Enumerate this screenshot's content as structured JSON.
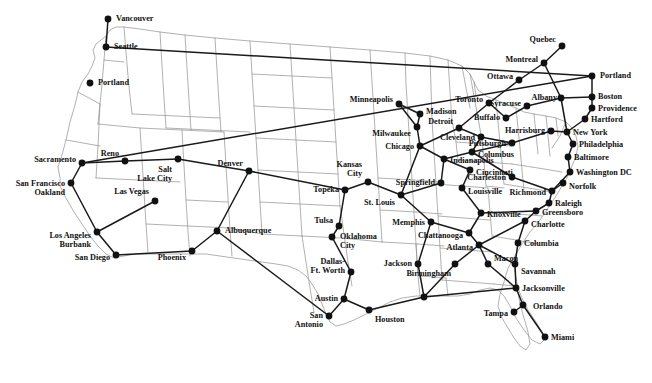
{
  "map": {
    "title": "United States Airline Route Network Map",
    "width": 652,
    "height": 383,
    "background_color": "#ffffff",
    "state_outline_color": "#8a8a8a",
    "route_color": "#1a1a1a",
    "node_color": "#111111",
    "label_color": "#111111"
  },
  "cities": [
    {
      "name": "Vancouver",
      "x": 108,
      "y": 19,
      "lx": 116,
      "ly": 15,
      "align": "l"
    },
    {
      "name": "Seattle",
      "x": 106,
      "y": 47,
      "lx": 114,
      "ly": 43,
      "align": "l"
    },
    {
      "name": "Portland",
      "x": 90,
      "y": 83,
      "lx": 98,
      "ly": 79,
      "align": "l"
    },
    {
      "name": "Sacramento",
      "x": 82,
      "y": 163,
      "lx": 76,
      "ly": 156,
      "align": "r"
    },
    {
      "name": "San Francisco\nOakland",
      "x": 71,
      "y": 183,
      "lx": 65,
      "ly": 180,
      "align": "r"
    },
    {
      "name": "Los Angeles\nBurbank",
      "x": 97,
      "y": 232,
      "lx": 91,
      "ly": 232,
      "align": "r"
    },
    {
      "name": "San Diego",
      "x": 116,
      "y": 255,
      "lx": 110,
      "ly": 254,
      "align": "r"
    },
    {
      "name": "Reno",
      "x": 125,
      "y": 161,
      "lx": 119,
      "ly": 150,
      "align": "r"
    },
    {
      "name": "Las Vegas",
      "x": 155,
      "y": 201,
      "lx": 149,
      "ly": 188,
      "align": "r"
    },
    {
      "name": "Phoenix",
      "x": 192,
      "y": 251,
      "lx": 186,
      "ly": 254,
      "align": "r"
    },
    {
      "name": "Salt\nLake City",
      "x": 178,
      "y": 159,
      "lx": 172,
      "ly": 166,
      "align": "r"
    },
    {
      "name": "Denver",
      "x": 249,
      "y": 171,
      "lx": 243,
      "ly": 160,
      "align": "r"
    },
    {
      "name": "Albuquerque",
      "x": 217,
      "y": 231,
      "lx": 225,
      "ly": 227,
      "align": "l"
    },
    {
      "name": "Topeka",
      "x": 345,
      "y": 190,
      "lx": 339,
      "ly": 186,
      "align": "r"
    },
    {
      "name": "Kansas\nCity",
      "x": 368,
      "y": 182,
      "lx": 362,
      "ly": 161,
      "align": "r"
    },
    {
      "name": "Tulsa",
      "x": 339,
      "y": 226,
      "lx": 333,
      "ly": 217,
      "align": "r"
    },
    {
      "name": "Oklahoma\nCity",
      "x": 332,
      "y": 237,
      "lx": 340,
      "ly": 233,
      "align": "l"
    },
    {
      "name": "Dallas-\nFt. Worth",
      "x": 351,
      "y": 272,
      "lx": 345,
      "ly": 258,
      "align": "r"
    },
    {
      "name": "Austin",
      "x": 344,
      "y": 299,
      "lx": 338,
      "ly": 295,
      "align": "r"
    },
    {
      "name": "San\nAntonio",
      "x": 329,
      "y": 316,
      "lx": 323,
      "ly": 312,
      "align": "r"
    },
    {
      "name": "Houston",
      "x": 369,
      "y": 310,
      "lx": 375,
      "ly": 316,
      "align": "l"
    },
    {
      "name": "Minneapolis",
      "x": 399,
      "y": 104,
      "lx": 393,
      "ly": 96,
      "align": "r"
    },
    {
      "name": "Madison",
      "x": 420,
      "y": 114,
      "lx": 426,
      "ly": 108,
      "align": "l"
    },
    {
      "name": "Milwaukee",
      "x": 417,
      "y": 127,
      "lx": 411,
      "ly": 130,
      "align": "r"
    },
    {
      "name": "Chicago",
      "x": 420,
      "y": 146,
      "lx": 414,
      "ly": 143,
      "align": "r"
    },
    {
      "name": "St. Louis",
      "x": 401,
      "y": 195,
      "lx": 395,
      "ly": 199,
      "align": "r"
    },
    {
      "name": "Springfield",
      "x": 441,
      "y": 183,
      "lx": 435,
      "ly": 179,
      "align": "r"
    },
    {
      "name": "Indianapolis",
      "x": 444,
      "y": 159,
      "lx": 450,
      "ly": 157,
      "align": "l"
    },
    {
      "name": "Detroit",
      "x": 459,
      "y": 128,
      "lx": 453,
      "ly": 118,
      "align": "r"
    },
    {
      "name": "Cincinnati",
      "x": 470,
      "y": 170,
      "lx": 476,
      "ly": 169,
      "align": "l"
    },
    {
      "name": "Louisville",
      "x": 462,
      "y": 188,
      "lx": 468,
      "ly": 188,
      "align": "l"
    },
    {
      "name": "Columbus",
      "x": 472,
      "y": 152,
      "lx": 478,
      "ly": 151,
      "align": "l"
    },
    {
      "name": "Cleveland",
      "x": 481,
      "y": 137,
      "lx": 475,
      "ly": 134,
      "align": "r"
    },
    {
      "name": "Toronto",
      "x": 489,
      "y": 103,
      "lx": 483,
      "ly": 96,
      "align": "r"
    },
    {
      "name": "Buffalo",
      "x": 506,
      "y": 118,
      "lx": 500,
      "ly": 114,
      "align": "r"
    },
    {
      "name": "Syracuse",
      "x": 527,
      "y": 106,
      "lx": 521,
      "ly": 100,
      "align": "r"
    },
    {
      "name": "Ottawa",
      "x": 519,
      "y": 80,
      "lx": 513,
      "ly": 73,
      "align": "r"
    },
    {
      "name": "Montreal",
      "x": 544,
      "y": 63,
      "lx": 538,
      "ly": 56,
      "align": "r"
    },
    {
      "name": "Quebec",
      "x": 562,
      "y": 46,
      "lx": 556,
      "ly": 36,
      "align": "r"
    },
    {
      "name": "Portland",
      "x": 592,
      "y": 76,
      "lx": 600,
      "ly": 72,
      "align": "l"
    },
    {
      "name": "Albany",
      "x": 561,
      "y": 98,
      "lx": 557,
      "ly": 94,
      "align": "r"
    },
    {
      "name": "Boston",
      "x": 592,
      "y": 97,
      "lx": 598,
      "ly": 93,
      "align": "l"
    },
    {
      "name": "Providence",
      "x": 592,
      "y": 108,
      "lx": 598,
      "ly": 105,
      "align": "l"
    },
    {
      "name": "Hartford",
      "x": 585,
      "y": 119,
      "lx": 591,
      "ly": 116,
      "align": "l"
    },
    {
      "name": "New York",
      "x": 567,
      "y": 132,
      "lx": 573,
      "ly": 129,
      "align": "l"
    },
    {
      "name": "Philadelphia",
      "x": 573,
      "y": 144,
      "lx": 579,
      "ly": 141,
      "align": "l"
    },
    {
      "name": "Harrisburg",
      "x": 551,
      "y": 131,
      "lx": 545,
      "ly": 127,
      "align": "r"
    },
    {
      "name": "Pittsburgh",
      "x": 512,
      "y": 143,
      "lx": 506,
      "ly": 140,
      "align": "r"
    },
    {
      "name": "Baltimore",
      "x": 568,
      "y": 157,
      "lx": 574,
      "ly": 154,
      "align": "l"
    },
    {
      "name": "Washington DC",
      "x": 570,
      "y": 172,
      "lx": 576,
      "ly": 169,
      "align": "l"
    },
    {
      "name": "Charleston",
      "x": 512,
      "y": 177,
      "lx": 506,
      "ly": 174,
      "align": "r"
    },
    {
      "name": "Richmond",
      "x": 552,
      "y": 191,
      "lx": 546,
      "ly": 189,
      "align": "r"
    },
    {
      "name": "Norfolk",
      "x": 563,
      "y": 183,
      "lx": 569,
      "ly": 183,
      "align": "l"
    },
    {
      "name": "Raleigh",
      "x": 549,
      "y": 203,
      "lx": 555,
      "ly": 200,
      "align": "l"
    },
    {
      "name": "Greensboro",
      "x": 536,
      "y": 211,
      "lx": 542,
      "ly": 209,
      "align": "l"
    },
    {
      "name": "Charlotte",
      "x": 525,
      "y": 221,
      "lx": 531,
      "ly": 221,
      "align": "l"
    },
    {
      "name": "Knoxville",
      "x": 481,
      "y": 213,
      "lx": 487,
      "ly": 211,
      "align": "l"
    },
    {
      "name": "Columbia",
      "x": 518,
      "y": 243,
      "lx": 524,
      "ly": 240,
      "align": "l"
    },
    {
      "name": "Memphis",
      "x": 431,
      "y": 222,
      "lx": 425,
      "ly": 219,
      "align": "r"
    },
    {
      "name": "Chattanooga",
      "x": 469,
      "y": 233,
      "lx": 463,
      "ly": 232,
      "align": "r"
    },
    {
      "name": "Atlanta",
      "x": 479,
      "y": 245,
      "lx": 473,
      "ly": 244,
      "align": "r"
    },
    {
      "name": "Macon",
      "x": 488,
      "y": 264,
      "lx": 494,
      "ly": 255,
      "align": "l"
    },
    {
      "name": "Birmingham",
      "x": 455,
      "y": 264,
      "lx": 451,
      "ly": 270,
      "align": "r"
    },
    {
      "name": "Jackson",
      "x": 418,
      "y": 264,
      "lx": 412,
      "ly": 260,
      "align": "r"
    },
    {
      "name": "Savannah",
      "x": 515,
      "y": 264,
      "lx": 521,
      "ly": 268,
      "align": "l"
    },
    {
      "name": "Jacksonville",
      "x": 516,
      "y": 288,
      "lx": 522,
      "ly": 285,
      "align": "l"
    },
    {
      "name": "Orlando",
      "x": 523,
      "y": 305,
      "lx": 533,
      "ly": 303,
      "align": "l"
    },
    {
      "name": "Tampa",
      "x": 514,
      "y": 312,
      "lx": 508,
      "ly": 310,
      "align": "r"
    },
    {
      "name": "Miami",
      "x": 545,
      "y": 337,
      "lx": 551,
      "ly": 334,
      "align": "l"
    },
    {
      "name": "New Orleans",
      "x": 424,
      "y": 297,
      "lx": 424,
      "ly": 297,
      "align": "n"
    }
  ],
  "routes": [
    [
      "Vancouver",
      "Seattle"
    ],
    [
      "Seattle",
      "Portland"
    ],
    [
      "Portland",
      "Sacramento"
    ],
    [
      "Sacramento",
      "San Francisco\nOakland"
    ],
    [
      "Sacramento",
      "Reno"
    ],
    [
      "Reno",
      "Salt\nLake City"
    ],
    [
      "Salt\nLake City",
      "Denver"
    ],
    [
      "San Francisco\nOakland",
      "Los Angeles\nBurbank"
    ],
    [
      "Los Angeles\nBurbank",
      "Las Vegas"
    ],
    [
      "Los Angeles\nBurbank",
      "San Diego"
    ],
    [
      "San Diego",
      "Phoenix"
    ],
    [
      "Phoenix",
      "Albuquerque"
    ],
    [
      "Albuquerque",
      "Denver"
    ],
    [
      "Albuquerque",
      "San\nAntonio"
    ],
    [
      "Denver",
      "Topeka"
    ],
    [
      "Topeka",
      "Kansas\nCity"
    ],
    [
      "Topeka",
      "Tulsa"
    ],
    [
      "Tulsa",
      "Oklahoma\nCity"
    ],
    [
      "Oklahoma\nCity",
      "Dallas-\nFt. Worth"
    ],
    [
      "Dallas-\nFt. Worth",
      "Austin"
    ],
    [
      "Austin",
      "San\nAntonio"
    ],
    [
      "Austin",
      "Houston"
    ],
    [
      "Houston",
      "New Orleans"
    ],
    [
      "Kansas\nCity",
      "St. Louis"
    ],
    [
      "St. Louis",
      "Chicago"
    ],
    [
      "St. Louis",
      "Springfield"
    ],
    [
      "St. Louis",
      "Memphis"
    ],
    [
      "Chicago",
      "Milwaukee"
    ],
    [
      "Milwaukee",
      "Madison"
    ],
    [
      "Madison",
      "Minneapolis"
    ],
    [
      "Minneapolis",
      "Milwaukee"
    ],
    [
      "Chicago",
      "Indianapolis"
    ],
    [
      "Chicago",
      "Detroit"
    ],
    [
      "Springfield",
      "Indianapolis"
    ],
    [
      "Indianapolis",
      "Cincinnati"
    ],
    [
      "Indianapolis",
      "Columbus"
    ],
    [
      "Cincinnati",
      "Louisville"
    ],
    [
      "Louisville",
      "Knoxville"
    ],
    [
      "Detroit",
      "Toronto"
    ],
    [
      "Detroit",
      "Cleveland"
    ],
    [
      "Cleveland",
      "Columbus"
    ],
    [
      "Cleveland",
      "Pittsburgh"
    ],
    [
      "Columbus",
      "Pittsburgh"
    ],
    [
      "Columbus",
      "Charleston"
    ],
    [
      "Toronto",
      "Buffalo"
    ],
    [
      "Toronto",
      "Ottawa"
    ],
    [
      "Ottawa",
      "Montreal"
    ],
    [
      "Montreal",
      "Quebec"
    ],
    [
      "Montreal",
      "Albany"
    ],
    [
      "Buffalo",
      "Syracuse"
    ],
    [
      "Syracuse",
      "Albany"
    ],
    [
      "Albany",
      "Boston"
    ],
    [
      "Albany",
      "New York"
    ],
    [
      "Boston",
      "Portland"
    ],
    [
      "Boston",
      "Providence"
    ],
    [
      "Providence",
      "Hartford"
    ],
    [
      "Hartford",
      "New York"
    ],
    [
      "New York",
      "Philadelphia"
    ],
    [
      "New York",
      "Harrisburg"
    ],
    [
      "Harrisburg",
      "Pittsburgh"
    ],
    [
      "Philadelphia",
      "Baltimore"
    ],
    [
      "Baltimore",
      "Washington DC"
    ],
    [
      "Washington DC",
      "Richmond"
    ],
    [
      "Richmond",
      "Norfolk"
    ],
    [
      "Richmond",
      "Raleigh"
    ],
    [
      "Raleigh",
      "Greensboro"
    ],
    [
      "Greensboro",
      "Charlotte"
    ],
    [
      "Charlotte",
      "Columbia"
    ],
    [
      "Columbia",
      "Savannah"
    ],
    [
      "Savannah",
      "Jacksonville"
    ],
    [
      "Charleston",
      "Richmond"
    ],
    [
      "Knoxville",
      "Chattanooga"
    ],
    [
      "Knoxville",
      "Greensboro"
    ],
    [
      "Memphis",
      "Chattanooga"
    ],
    [
      "Chattanooga",
      "Atlanta"
    ],
    [
      "Atlanta",
      "Macon"
    ],
    [
      "Atlanta",
      "Birmingham"
    ],
    [
      "Macon",
      "Jacksonville"
    ],
    [
      "Birmingham",
      "New Orleans"
    ],
    [
      "Jackson",
      "New Orleans"
    ],
    [
      "Memphis",
      "Jackson"
    ],
    [
      "New Orleans",
      "Jacksonville"
    ],
    [
      "Jacksonville",
      "Orlando"
    ],
    [
      "Orlando",
      "Tampa"
    ],
    [
      "Orlando",
      "Miami"
    ],
    [
      "Atlanta",
      "Savannah"
    ],
    [
      "Charlotte",
      "Atlanta"
    ]
  ]
}
